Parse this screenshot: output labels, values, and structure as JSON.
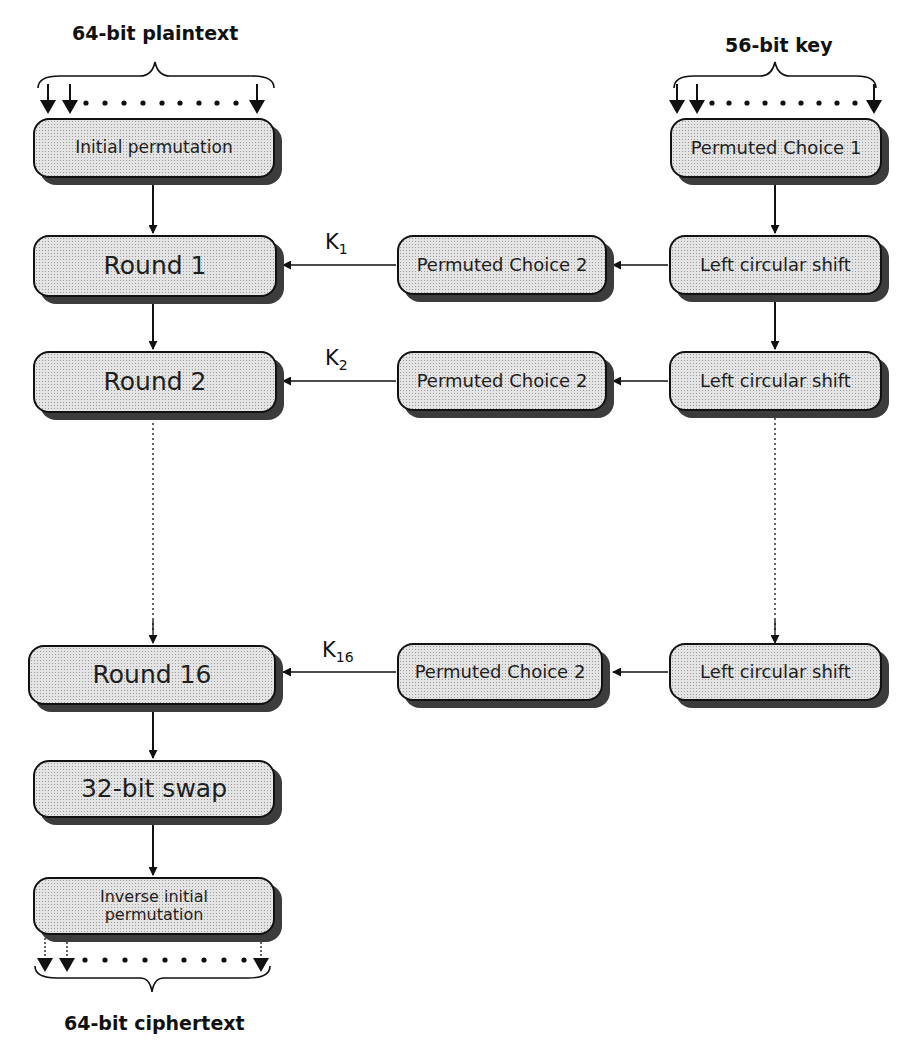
{
  "diagram": {
    "type": "flowchart",
    "inputs": {
      "plaintext_label": "64-bit plaintext",
      "key_label": "56-bit key"
    },
    "output": {
      "ciphertext_label": "64-bit ciphertext"
    },
    "data_path": {
      "initial_permutation": "Initial permutation",
      "round_1": "Round 1",
      "round_2": "Round 2",
      "round_16": "Round 16",
      "swap": "32-bit swap",
      "inverse_ip_line1": "Inverse initial",
      "inverse_ip_line2": "permutation"
    },
    "key_schedule": {
      "pc1": "Permuted Choice 1",
      "pc2_1": "Permuted Choice 2",
      "pc2_2": "Permuted Choice 2",
      "pc2_16": "Permuted Choice 2",
      "shift_1": "Left circular shift",
      "shift_2": "Left circular shift",
      "shift_16": "Left circular shift"
    },
    "subkeys": {
      "k1": {
        "base": "K",
        "sub": "1"
      },
      "k2": {
        "base": "K",
        "sub": "2"
      },
      "k16": {
        "base": "K",
        "sub": "16"
      }
    },
    "colors": {
      "line": "#111111",
      "box_fill": "#e4e4e4",
      "shadow": "#3c3c3c"
    }
  }
}
